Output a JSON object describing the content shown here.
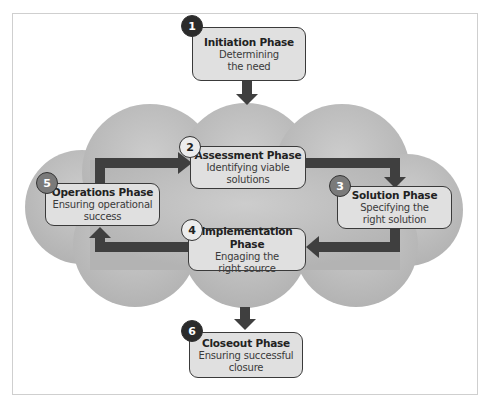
{
  "diagram": {
    "phases": [
      {
        "number": "1",
        "title": "Initiation Phase",
        "line1": "Determining",
        "line2": "the need"
      },
      {
        "number": "2",
        "title": "Assessment Phase",
        "line1": "Identifying viable",
        "line2": "solutions"
      },
      {
        "number": "3",
        "title": "Solution Phase",
        "line1": "Specifying the",
        "line2": "right solution"
      },
      {
        "number": "4",
        "title": "Implementation Phase",
        "line1": "Engaging the",
        "line2": "right source"
      },
      {
        "number": "5",
        "title": "Operations Phase",
        "line1": "Ensuring operational",
        "line2": "success"
      },
      {
        "number": "6",
        "title": "Closeout Phase",
        "line1": "Ensuring successful",
        "line2": "closure"
      }
    ],
    "flow": [
      {
        "from": "1",
        "to": "2"
      },
      {
        "from": "2",
        "to": "3"
      },
      {
        "from": "3",
        "to": "4"
      },
      {
        "from": "4",
        "to": "5"
      },
      {
        "from": "5",
        "to": "2"
      },
      {
        "from": "cycle",
        "to": "6"
      }
    ],
    "colors": {
      "cloud": "#bdbdbd",
      "arrow": "#3f3f3f",
      "box_fill": "#e0e0e0",
      "badge_dark": "#2b2b2b",
      "badge_mid": "#7a7a7a",
      "badge_light": "#ececec"
    }
  }
}
